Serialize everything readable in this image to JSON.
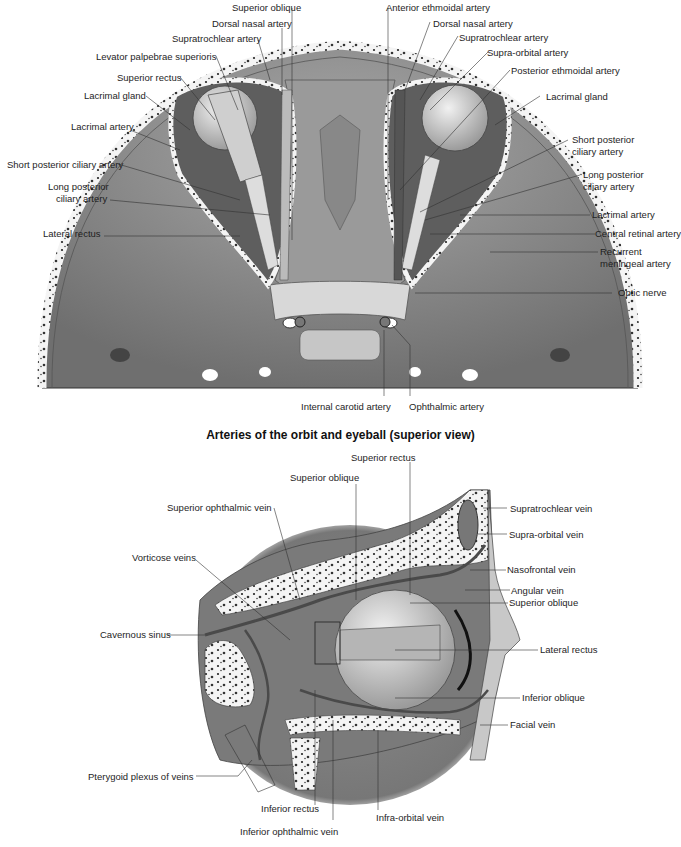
{
  "figure_top": {
    "caption": "Arteries of the orbit and eyeball (superior view)",
    "labels_left": [
      "Superior oblique",
      "Dorsal nasal artery",
      "Supratrochlear artery",
      "Levator palpebrae superioris",
      "Superior rectus",
      "Lacrimal gland",
      "Lacrimal artery",
      "Short posterior ciliary artery",
      "Long posterior",
      "ciliary artery",
      "Lateral rectus"
    ],
    "labels_right": [
      "Anterior ethmoidal artery",
      "Dorsal nasal artery",
      "Supratrochlear artery",
      "Supra-orbital artery",
      "Posterior ethmoidal artery",
      "Lacrimal gland",
      "Short posterior",
      "ciliary artery",
      "Long posterior",
      "ciliary artery",
      "Lacrimal artery",
      "Central retinal artery",
      "Recurrent",
      "meningeal artery",
      "Optic nerve"
    ],
    "labels_bottom": [
      "Internal carotid artery",
      "Ophthalmic artery"
    ]
  },
  "figure_bottom": {
    "labels_top": [
      "Superior rectus",
      "Superior oblique"
    ],
    "labels_left": [
      "Superior ophthalmic vein",
      "Vorticose veins",
      "Cavernous sinus",
      "Pterygoid plexus of veins"
    ],
    "labels_right": [
      "Supratrochlear vein",
      "Supra-orbital vein",
      "Nasofrontal vein",
      "Angular vein",
      "Superior oblique",
      "Lateral rectus",
      "Inferior oblique",
      "Facial vein"
    ],
    "labels_bottom": [
      "Inferior rectus",
      "Infra-orbital vein",
      "Inferior ophthalmic vein"
    ]
  }
}
